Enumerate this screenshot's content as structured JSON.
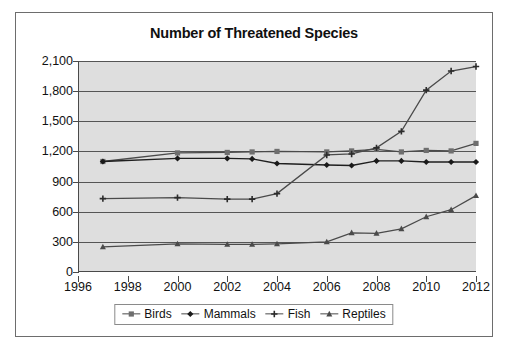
{
  "chart_data": {
    "type": "line",
    "title": "Number of Threatened Species",
    "xlabel": "",
    "ylabel": "",
    "xlim": [
      1996,
      2012
    ],
    "ylim": [
      0,
      2100
    ],
    "grid": true,
    "legend_position": "bottom",
    "x_ticks": [
      "1996",
      "1998",
      "2000",
      "2002",
      "2004",
      "2006",
      "2008",
      "2010",
      "2012"
    ],
    "y_ticks": [
      "0",
      "300",
      "600",
      "900",
      "1,200",
      "1,500",
      "1,800",
      "2,100"
    ],
    "x": [
      1997,
      2000,
      2002,
      2003,
      2004,
      2006,
      2007,
      2008,
      2009,
      2010,
      2011,
      2012
    ],
    "series": [
      {
        "name": "Birds",
        "marker": "square",
        "color": "#4a4a4a",
        "values": [
          1100,
          1185,
          1190,
          1195,
          1200,
          1195,
          1205,
          1220,
          1195,
          1210,
          1205,
          1280
        ]
      },
      {
        "name": "Mammals",
        "marker": "diamond",
        "color": "#1f1f1f",
        "values": [
          1100,
          1130,
          1130,
          1125,
          1080,
          1065,
          1060,
          1105,
          1105,
          1095,
          1095,
          1095
        ]
      },
      {
        "name": "Fish",
        "marker": "plus",
        "color": "#4a4a4a",
        "values": [
          730,
          740,
          725,
          725,
          780,
          1165,
          1175,
          1235,
          1400,
          1810,
          2000,
          2045
        ]
      },
      {
        "name": "Reptiles",
        "marker": "triangle",
        "color": "#4a4a4a",
        "values": [
          250,
          280,
          275,
          275,
          280,
          300,
          390,
          385,
          430,
          550,
          620,
          760
        ]
      }
    ]
  },
  "legend": {
    "items": [
      {
        "label": "Birds"
      },
      {
        "label": "Mammals"
      },
      {
        "label": "Fish"
      },
      {
        "label": "Reptiles"
      }
    ]
  }
}
